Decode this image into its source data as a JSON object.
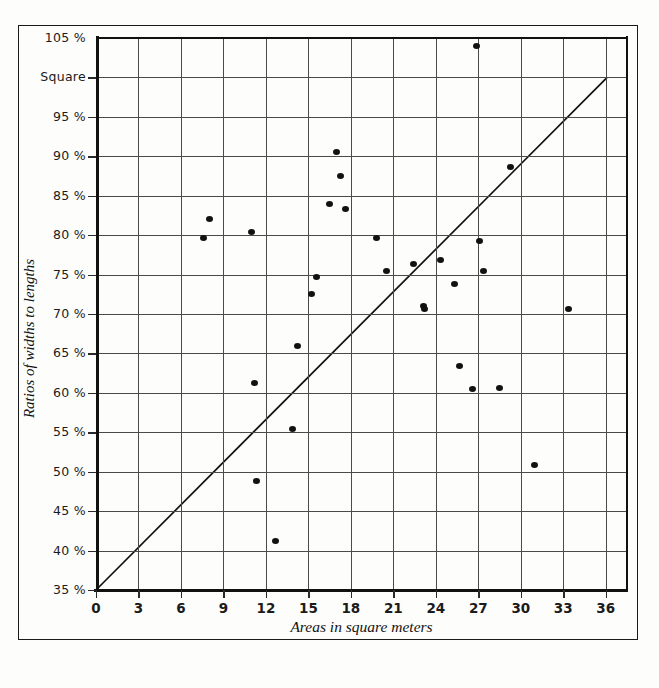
{
  "chart_data": {
    "type": "scatter",
    "title": "",
    "xlabel": "Areas in square meters",
    "ylabel": "Ratios of widths to lengths",
    "xlim": [
      0,
      37.5
    ],
    "ylim": [
      35,
      105
    ],
    "grid": true,
    "legend": "none",
    "x_ticks": [
      0,
      3,
      6,
      9,
      12,
      15,
      18,
      21,
      24,
      27,
      30,
      33,
      36
    ],
    "x_tick_labels": [
      "0",
      "3",
      "6",
      "9",
      "12",
      "15",
      "18",
      "21",
      "24",
      "27",
      "30",
      "33",
      "36"
    ],
    "y_ticks": [
      35,
      40,
      45,
      50,
      55,
      60,
      65,
      70,
      75,
      80,
      85,
      90,
      95,
      100,
      105
    ],
    "y_tick_labels": [
      "35 %",
      "40 %",
      "45 %",
      "50 %",
      "55 %",
      "60 %",
      "65 %",
      "70 %",
      "75 %",
      "80 %",
      "85 %",
      "90 %",
      "95 %",
      "Square",
      "105 %"
    ],
    "annotations": [
      {
        "name": "reference-line",
        "type": "line",
        "x0": 0,
        "y0": 35,
        "x1": 36.1,
        "y1": 100,
        "note": "straight trend line from origin"
      }
    ],
    "points": [
      {
        "x": 7.6,
        "y": 79.6
      },
      {
        "x": 8.0,
        "y": 82.0
      },
      {
        "x": 11.0,
        "y": 80.4
      },
      {
        "x": 11.2,
        "y": 61.3
      },
      {
        "x": 11.3,
        "y": 48.8
      },
      {
        "x": 12.7,
        "y": 41.2
      },
      {
        "x": 13.9,
        "y": 55.4
      },
      {
        "x": 14.2,
        "y": 65.9
      },
      {
        "x": 15.2,
        "y": 72.5
      },
      {
        "x": 15.6,
        "y": 74.7
      },
      {
        "x": 16.5,
        "y": 83.9
      },
      {
        "x": 17.0,
        "y": 90.5
      },
      {
        "x": 17.3,
        "y": 87.5
      },
      {
        "x": 17.6,
        "y": 83.3
      },
      {
        "x": 19.8,
        "y": 79.7
      },
      {
        "x": 20.5,
        "y": 75.5
      },
      {
        "x": 22.4,
        "y": 76.3
      },
      {
        "x": 23.1,
        "y": 71.0
      },
      {
        "x": 23.2,
        "y": 70.6
      },
      {
        "x": 24.3,
        "y": 76.8
      },
      {
        "x": 25.3,
        "y": 73.8
      },
      {
        "x": 25.7,
        "y": 63.4
      },
      {
        "x": 26.6,
        "y": 60.5
      },
      {
        "x": 26.9,
        "y": 104.0
      },
      {
        "x": 27.1,
        "y": 79.2
      },
      {
        "x": 27.4,
        "y": 75.4
      },
      {
        "x": 28.5,
        "y": 60.6
      },
      {
        "x": 29.3,
        "y": 88.6
      },
      {
        "x": 31.0,
        "y": 50.9
      },
      {
        "x": 33.4,
        "y": 70.6
      }
    ]
  },
  "figure": {
    "caption": ""
  }
}
